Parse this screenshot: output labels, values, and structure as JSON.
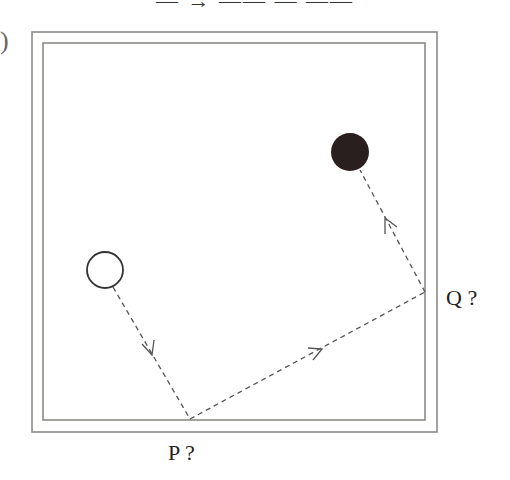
{
  "header": {
    "cropped_text": "— → —— — ——",
    "left_paren": ")"
  },
  "diagram": {
    "table": {
      "outer": {
        "x": 32,
        "y": 32,
        "width": 405,
        "height": 400
      },
      "inner": {
        "x": 43,
        "y": 43,
        "width": 382,
        "height": 377
      },
      "stroke_color": "#8a8a85"
    },
    "white_ball": {
      "cx": 105,
      "cy": 270,
      "r": 18,
      "fill": "#ffffff",
      "stroke": "#333333"
    },
    "black_ball": {
      "cx": 350,
      "cy": 152,
      "r": 19,
      "fill": "#2a1f1f"
    },
    "path_points": [
      [
        113,
        287
      ],
      [
        190,
        419
      ],
      [
        425,
        292
      ],
      [
        360,
        170
      ]
    ],
    "labels": {
      "p": "P ?",
      "q": "Q ?"
    },
    "colors": {
      "path": "#555555",
      "border": "#8a8a85"
    }
  }
}
